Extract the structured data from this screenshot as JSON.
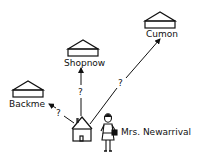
{
  "diagram": {
    "stores": [
      {
        "name": "Backme"
      },
      {
        "name": "Shopnow"
      },
      {
        "name": "Cumon"
      }
    ],
    "person": {
      "label": "Mrs. Newarrival"
    },
    "edges": [
      {
        "from": "home",
        "to": "Backme",
        "label": "?"
      },
      {
        "from": "home",
        "to": "Shopnow",
        "label": "?"
      },
      {
        "from": "home",
        "to": "Cumon",
        "label": "?"
      }
    ],
    "colors": {
      "ink": "#111111",
      "background": "#ffffff"
    }
  }
}
